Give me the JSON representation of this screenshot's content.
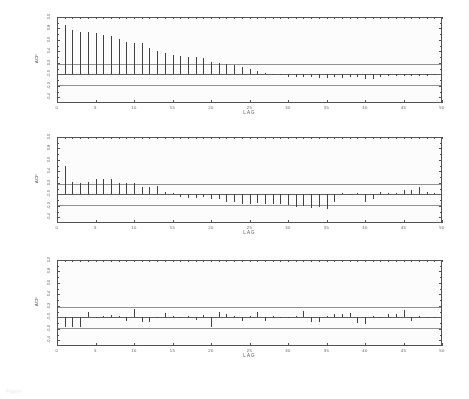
{
  "figure": {
    "caption": "Figure",
    "background_color": "#ffffff",
    "bar_color": "#3a3a3a",
    "axis_color": "#4a4a4a",
    "confidence_band_color": "#8e8e8e"
  },
  "axis": {
    "ylabel": "ACF",
    "xlabel": "LAG",
    "yticks": [
      "1.0",
      "0.8",
      "0.6",
      "0.4",
      "0.2",
      "-0.0",
      "-0.2",
      "-0.4"
    ],
    "ytick_values": [
      1.0,
      0.8,
      0.6,
      0.4,
      0.2,
      0.0,
      -0.2,
      -0.4
    ],
    "xticks": [
      "0",
      "5",
      "10",
      "15",
      "20",
      "25",
      "30",
      "35",
      "40",
      "45",
      "50"
    ],
    "xtick_values": [
      0,
      5,
      10,
      15,
      20,
      25,
      30,
      35,
      40,
      45,
      50
    ],
    "ylim": [
      -0.5,
      1.0
    ],
    "xlim": [
      0,
      50
    ]
  },
  "chart_data": [
    {
      "type": "bar",
      "title": "ACF of original series",
      "xlabel": "LAG",
      "ylabel": "ACF",
      "ylim": [
        -0.5,
        1.0
      ],
      "xlim": [
        0,
        50
      ],
      "grid": false,
      "legend": "none",
      "confidence_bounds": [
        0.18,
        -0.18
      ],
      "zero_line": 0.0,
      "x": [
        1,
        2,
        3,
        4,
        5,
        6,
        7,
        8,
        9,
        10,
        11,
        12,
        13,
        14,
        15,
        16,
        17,
        18,
        19,
        20,
        21,
        22,
        23,
        24,
        25,
        26,
        27,
        28,
        29,
        30,
        31,
        32,
        33,
        34,
        35,
        36,
        37,
        38,
        39,
        40,
        41,
        42,
        43,
        44,
        45,
        46,
        47,
        48,
        49
      ],
      "values": [
        0.86,
        0.78,
        0.73,
        0.73,
        0.72,
        0.69,
        0.66,
        0.62,
        0.56,
        0.55,
        0.54,
        0.46,
        0.4,
        0.37,
        0.34,
        0.32,
        0.31,
        0.3,
        0.28,
        0.21,
        0.2,
        0.18,
        0.16,
        0.12,
        0.09,
        0.06,
        0.03,
        0.01,
        -0.02,
        -0.04,
        -0.04,
        -0.05,
        -0.04,
        -0.07,
        -0.07,
        -0.05,
        -0.07,
        -0.04,
        -0.05,
        -0.09,
        -0.09,
        -0.04,
        -0.03,
        -0.03,
        -0.03,
        -0.03,
        -0.03,
        -0.03,
        -0.02
      ]
    },
    {
      "type": "bar",
      "title": "ACF of differenced series",
      "xlabel": "LAG",
      "ylabel": "ACF",
      "ylim": [
        -0.5,
        1.0
      ],
      "xlim": [
        0,
        50
      ],
      "grid": false,
      "legend": "none",
      "confidence_bounds": [
        0.18,
        -0.18
      ],
      "zero_line": 0.0,
      "x": [
        1,
        2,
        3,
        4,
        5,
        6,
        7,
        8,
        9,
        10,
        11,
        12,
        13,
        14,
        15,
        16,
        17,
        18,
        19,
        20,
        21,
        22,
        23,
        24,
        25,
        26,
        27,
        28,
        29,
        30,
        31,
        32,
        33,
        34,
        35,
        36,
        37,
        38,
        39,
        40,
        41,
        42,
        43,
        44,
        45,
        46,
        47,
        48,
        49
      ],
      "values": [
        0.5,
        0.21,
        0.2,
        0.21,
        0.26,
        0.26,
        0.26,
        0.19,
        0.2,
        0.19,
        0.13,
        0.13,
        0.15,
        0.04,
        0.02,
        -0.04,
        -0.06,
        -0.07,
        -0.04,
        -0.09,
        -0.08,
        -0.13,
        -0.14,
        -0.16,
        -0.16,
        -0.15,
        -0.17,
        -0.17,
        -0.16,
        -0.19,
        -0.22,
        -0.21,
        -0.24,
        -0.22,
        -0.26,
        -0.14,
        0.03,
        -0.02,
        0.03,
        -0.13,
        -0.09,
        0.04,
        0.03,
        0.02,
        0.07,
        0.08,
        0.12,
        0.04,
        0.02
      ]
    },
    {
      "type": "bar",
      "title": "ACF of residuals (white noise)",
      "xlabel": "LAG",
      "ylabel": "ACF",
      "ylim": [
        -0.5,
        1.0
      ],
      "xlim": [
        0,
        50
      ],
      "grid": false,
      "legend": "none",
      "confidence_bounds": [
        0.18,
        -0.18
      ],
      "zero_line": 0.0,
      "x": [
        1,
        2,
        3,
        4,
        5,
        6,
        7,
        8,
        9,
        10,
        11,
        12,
        13,
        14,
        15,
        16,
        17,
        18,
        19,
        20,
        21,
        22,
        23,
        24,
        25,
        26,
        27,
        28,
        29,
        30,
        31,
        32,
        33,
        34,
        35,
        36,
        37,
        38,
        39,
        40,
        41,
        42,
        43,
        44,
        45,
        46,
        47,
        48,
        49
      ],
      "values": [
        -0.16,
        -0.16,
        -0.16,
        0.1,
        -0.01,
        0.03,
        0.04,
        0.02,
        -0.06,
        0.14,
        -0.08,
        -0.09,
        0.0,
        0.08,
        0.02,
        0.01,
        0.03,
        -0.05,
        0.04,
        -0.16,
        0.09,
        0.05,
        0.03,
        -0.06,
        0.02,
        0.09,
        -0.06,
        0.02,
        0.01,
        -0.02,
        0.02,
        0.11,
        -0.09,
        -0.08,
        0.02,
        0.05,
        0.06,
        0.08,
        -0.1,
        -0.11,
        0.03,
        0.01,
        0.05,
        0.06,
        0.13,
        -0.07,
        0.02,
        -0.02,
        0.0
      ]
    }
  ]
}
